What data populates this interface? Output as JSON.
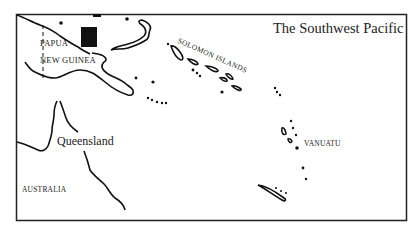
{
  "map": {
    "title": "The Southwest Pacific",
    "labels": {
      "papua": "PAPUA",
      "new_guinea": "NEW GUINEA",
      "queensland": "Queensland",
      "australia": "AUSTRALIA",
      "solomon_islands": "SOLOMON ISLANDS",
      "vanuatu": "VANUATU"
    },
    "marker": {
      "label": "T"
    },
    "colors": {
      "ink": "#111111",
      "background": "#ffffff"
    }
  }
}
